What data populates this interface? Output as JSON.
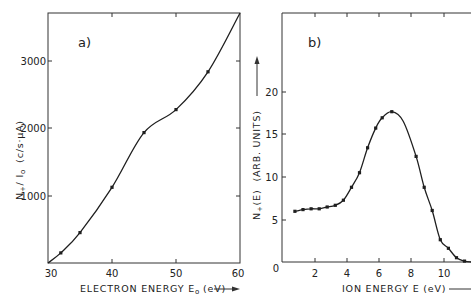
{
  "chart_data": [
    {
      "type": "line",
      "panel_label": "a)",
      "title": "",
      "xlabel": "ELECTRON ENERGY E₀ (eV)",
      "ylabel": "N₊/I₀   (c/s·µA)",
      "xlim": [
        30,
        60
      ],
      "ylim": [
        0,
        3700
      ],
      "xticks": [
        30,
        40,
        50,
        60
      ],
      "yticks": [
        1000,
        2000,
        3000
      ],
      "grid": false,
      "series": [
        {
          "name": "measured",
          "marker": "dot",
          "x": [
            30,
            32,
            35,
            40,
            45,
            50,
            55,
            60
          ],
          "y": [
            0,
            150,
            450,
            1120,
            1930,
            2270,
            2830,
            3700
          ]
        }
      ]
    },
    {
      "type": "line",
      "panel_label": "b)",
      "title": "",
      "xlabel": "ION ENERGY  E  (eV)",
      "ylabel": "N₊(E)   (ARB. UNITS)",
      "xlim": [
        0,
        11.7
      ],
      "ylim": [
        0,
        29
      ],
      "xticks": [
        2,
        4,
        6,
        8,
        10
      ],
      "yticks": [
        0,
        5,
        10,
        15,
        20
      ],
      "grid": false,
      "series": [
        {
          "name": "measured",
          "marker": "dot",
          "x": [
            0.8,
            1.3,
            1.8,
            2.3,
            2.8,
            3.3,
            3.8,
            4.3,
            4.8,
            5.3,
            5.8,
            6.2,
            6.8,
            8.3,
            8.8,
            9.3,
            9.8,
            10.3,
            10.8,
            11.3
          ],
          "y": [
            5.9,
            6.1,
            6.2,
            6.2,
            6.4,
            6.6,
            7.2,
            8.7,
            10.4,
            13.3,
            15.6,
            16.8,
            17.5,
            12.3,
            8.7,
            6.0,
            2.6,
            1.6,
            0.5,
            0.1
          ]
        }
      ]
    }
  ],
  "labels": {
    "a": {
      "panel": "a)",
      "x_ticks": [
        "30",
        "40",
        "50",
        "60"
      ],
      "y_ticks": [
        "1000",
        "2000",
        "3000"
      ],
      "xlabel": "ELECTRON ENERGY  E",
      "xlabel_sub": "o",
      "xlabel_unit": "(eV)",
      "ylabel_main": "N",
      "ylabel_sub1": "+",
      "ylabel_rest": "/ I",
      "ylabel_sub2": "o",
      "ylabel_unit": "(c/s·µA)"
    },
    "b": {
      "panel": "b)",
      "x_ticks": [
        "2",
        "4",
        "6",
        "8",
        "10"
      ],
      "y_ticks": [
        "0",
        "5",
        "10",
        "15",
        "20"
      ],
      "xlabel": "ION  ENERGY  E   (eV)",
      "ylabel_main": "N",
      "ylabel_sub": "+",
      "ylabel_rest": "(E)",
      "ylabel_unit": "(ARB. UNITS)"
    }
  },
  "colors": {
    "ink": "#1f1f1f",
    "background": "#ffffff"
  }
}
